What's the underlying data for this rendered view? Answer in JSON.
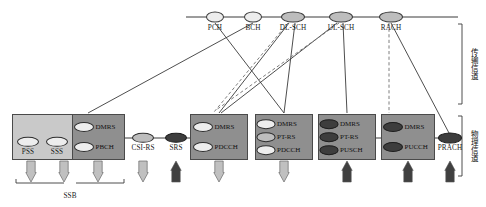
{
  "diagram": {
    "colors": {
      "rail": "#3a3a3a",
      "solid_link": "#3a3a3a",
      "dashed_link": "#6f6f6f",
      "box_light": "#c9c9c9",
      "box_dark": "#8f8f8f",
      "arrow_down": "#c0c0c0",
      "arrow_up": "#404040",
      "chip_light": "#ededed",
      "chip_mid": "#bdbdbd",
      "chip_dark": "#3d3d3d",
      "text": "#111111"
    }
  },
  "transport_channels": [
    {
      "id": "pch",
      "label": "PCH",
      "x": 215,
      "y": 17,
      "rx": 8,
      "ry": 4.5,
      "fill": "light"
    },
    {
      "id": "bch",
      "label": "BCH",
      "x": 253,
      "y": 17,
      "rx": 8,
      "ry": 4.5,
      "fill": "light"
    },
    {
      "id": "dlsch",
      "label": "DL-SCH",
      "x": 293,
      "y": 17,
      "rx": 11,
      "ry": 4.5,
      "fill": "mid"
    },
    {
      "id": "ulsch",
      "label": "UL-SCH",
      "x": 341,
      "y": 17,
      "rx": 11,
      "ry": 4.5,
      "fill": "mid"
    },
    {
      "id": "rach",
      "label": "RACH",
      "x": 391,
      "y": 17,
      "rx": 11,
      "ry": 4.5,
      "fill": "mid"
    }
  ],
  "rail": {
    "x1": 186,
    "x2": 458,
    "y": 17
  },
  "physical_groups": [
    {
      "id": "ssb-group",
      "label": "SSB",
      "outer_box": {
        "x": 12,
        "y": 114,
        "w": 113,
        "h": 46,
        "shade": "light"
      },
      "inner_box": {
        "x": 72,
        "y": 114,
        "w": 53,
        "h": 46,
        "shade": "dark"
      },
      "chips": [
        {
          "id": "pss",
          "label": "PSS",
          "cx": 28,
          "cy": 142,
          "rx": 10,
          "ry": 4.2,
          "fill": "lite",
          "label_pos": "below"
        },
        {
          "id": "sss",
          "label": "SSS",
          "cx": 57,
          "cy": 142,
          "rx": 10,
          "ry": 4.2,
          "fill": "lite",
          "label_pos": "below"
        },
        {
          "id": "dmrs",
          "label": "DMRS",
          "cx": 84,
          "cy": 127,
          "rx": 9,
          "ry": 4,
          "fill": "lite",
          "label_pos": "right"
        },
        {
          "id": "pbch",
          "label": "PBCH",
          "cx": 84,
          "cy": 147,
          "rx": 9,
          "ry": 4,
          "fill": "lite",
          "label_pos": "right"
        }
      ]
    },
    {
      "id": "pdcch-group-1",
      "outer_box": {
        "x": 190,
        "y": 114,
        "w": 58,
        "h": 46,
        "shade": "dark"
      },
      "chips": [
        {
          "id": "dmrs",
          "label": "DMRS",
          "cx": 203,
          "cy": 127,
          "rx": 9,
          "ry": 4,
          "fill": "lite",
          "label_pos": "right"
        },
        {
          "id": "pdcch",
          "label": "PDCCH",
          "cx": 203,
          "cy": 147,
          "rx": 9,
          "ry": 4,
          "fill": "lite",
          "label_pos": "right"
        }
      ]
    },
    {
      "id": "pdsch-group",
      "outer_box": {
        "x": 255,
        "y": 114,
        "w": 58,
        "h": 46,
        "shade": "dark"
      },
      "chips": [
        {
          "id": "dmrs",
          "label": "DMRS",
          "cx": 266,
          "cy": 124,
          "rx": 8.5,
          "ry": 3.8,
          "fill": "lite",
          "label_pos": "right"
        },
        {
          "id": "ptrs",
          "label": "PT-RS",
          "cx": 266,
          "cy": 137,
          "rx": 8.5,
          "ry": 3.8,
          "fill": "mid",
          "label_pos": "right"
        },
        {
          "id": "pdcch2",
          "label": "PDCCH",
          "cx": 266,
          "cy": 150,
          "rx": 8.5,
          "ry": 3.8,
          "fill": "lite",
          "label_pos": "right"
        }
      ]
    },
    {
      "id": "pusch-group",
      "outer_box": {
        "x": 318,
        "y": 114,
        "w": 58,
        "h": 46,
        "shade": "dark"
      },
      "chips": [
        {
          "id": "dmrs",
          "label": "DMRS",
          "cx": 329,
          "cy": 124,
          "rx": 8.5,
          "ry": 3.8,
          "fill": "drk",
          "label_pos": "right"
        },
        {
          "id": "ptrs",
          "label": "PT-RS",
          "cx": 329,
          "cy": 137,
          "rx": 8.5,
          "ry": 3.8,
          "fill": "drk",
          "label_pos": "right"
        },
        {
          "id": "pusch",
          "label": "PUSCH",
          "cx": 329,
          "cy": 150,
          "rx": 8.5,
          "ry": 3.8,
          "fill": "drk",
          "label_pos": "right"
        }
      ]
    },
    {
      "id": "pucch-group",
      "outer_box": {
        "x": 381,
        "y": 114,
        "w": 54,
        "h": 46,
        "shade": "dark"
      },
      "chips": [
        {
          "id": "dmrs",
          "label": "DMRS",
          "cx": 393,
          "cy": 127,
          "rx": 9,
          "ry": 4,
          "fill": "drk",
          "label_pos": "right"
        },
        {
          "id": "pucch",
          "label": "PUCCH",
          "cx": 393,
          "cy": 147,
          "rx": 9,
          "ry": 4,
          "fill": "drk",
          "label_pos": "right"
        }
      ]
    }
  ],
  "standalone_signals": [
    {
      "id": "csirs",
      "label": "CSI-RS",
      "cx": 143,
      "cy": 138,
      "rx": 10,
      "ry": 4.2,
      "fill": "mid",
      "label_pos": "below"
    },
    {
      "id": "srs",
      "label": "SRS",
      "cx": 176,
      "cy": 138,
      "rx": 10,
      "ry": 4.2,
      "fill": "drk",
      "label_pos": "below"
    },
    {
      "id": "prach",
      "label": "PRACH",
      "cx": 450,
      "cy": 138,
      "rx": 11,
      "ry": 4.5,
      "fill": "drk",
      "label_pos": "below"
    }
  ],
  "arrows": [
    {
      "id": "arrow-pss",
      "x": 31,
      "dir": "down"
    },
    {
      "id": "arrow-sss",
      "x": 64,
      "dir": "down"
    },
    {
      "id": "arrow-pbch",
      "x": 98,
      "dir": "down"
    },
    {
      "id": "arrow-csirs",
      "x": 143,
      "dir": "down"
    },
    {
      "id": "arrow-srs",
      "x": 176,
      "dir": "up"
    },
    {
      "id": "arrow-pdcch",
      "x": 219,
      "dir": "down"
    },
    {
      "id": "arrow-pdsch",
      "x": 284,
      "dir": "down"
    },
    {
      "id": "arrow-pusch",
      "x": 347,
      "dir": "up"
    },
    {
      "id": "arrow-pucch",
      "x": 408,
      "dir": "up"
    },
    {
      "id": "arrow-prach",
      "x": 450,
      "dir": "up"
    }
  ],
  "braces": {
    "ssb": {
      "label": "SSB",
      "x1": 16,
      "x2": 124,
      "y": 183,
      "label_x": 70,
      "label_y": 193
    },
    "transport_side": {
      "label": "传输信道",
      "x": 462,
      "y1": 24,
      "y2": 104,
      "label_x": 470,
      "label_y": 64
    },
    "physical_side": {
      "label": "物理信道",
      "x": 462,
      "y1": 116,
      "y2": 176,
      "label_x": 470,
      "label_y": 146
    }
  },
  "links": [
    {
      "id": "bch-to-pbch",
      "from": "BCH",
      "to": "PBCH",
      "style": "solid",
      "x1": 253,
      "y1": 23,
      "x2": 88,
      "y2": 113
    },
    {
      "id": "pch-to-pdsch",
      "from": "PCH",
      "to": "PDSCH",
      "style": "solid",
      "x1": 215,
      "y1": 23,
      "x2": 284,
      "y2": 113
    },
    {
      "id": "dlsch-to-pdcch",
      "from": "DL-SCH",
      "to": "PDCCH",
      "style": "solid",
      "x1": 289,
      "y1": 23,
      "x2": 219,
      "y2": 113
    },
    {
      "id": "dlsch-to-pdsch",
      "from": "DL-SCH",
      "to": "PDSCH",
      "style": "solid",
      "x1": 295,
      "y1": 23,
      "x2": 284,
      "y2": 113
    },
    {
      "id": "ulsch-to-pusch",
      "from": "UL-SCH",
      "to": "PUSCH",
      "style": "solid",
      "x1": 343,
      "y1": 23,
      "x2": 347,
      "y2": 113
    },
    {
      "id": "ulsch-to-pdcch",
      "from": "UL-SCH",
      "to": "PDCCH",
      "style": "solid",
      "x1": 337,
      "y1": 23,
      "x2": 221,
      "y2": 113
    },
    {
      "id": "rach-to-prach",
      "from": "RACH",
      "to": "PRACH",
      "style": "solid",
      "x1": 391,
      "y1": 23,
      "x2": 449,
      "y2": 133
    },
    {
      "id": "dlsch-dash-1",
      "from": "DL-SCH",
      "to": "PDCCH",
      "style": "dashed",
      "x1": 288,
      "y1": 23,
      "x2": 214,
      "y2": 112
    },
    {
      "id": "ulsch-dash-1",
      "from": "UL-SCH",
      "to": "PDCCH",
      "style": "dashed",
      "x1": 339,
      "y1": 23,
      "x2": 216,
      "y2": 110
    },
    {
      "id": "rach-dash-1",
      "from": "RACH",
      "to": "PUCCH",
      "style": "dashed",
      "x1": 389,
      "y1": 23,
      "x2": 389,
      "y2": 113
    }
  ]
}
